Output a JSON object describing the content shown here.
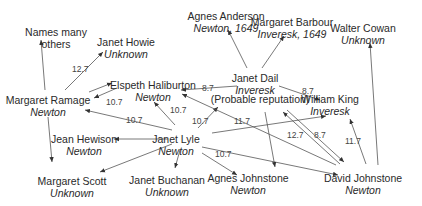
{
  "nodes": [
    {
      "id": "names_many",
      "name": "Names many",
      "sub": "others",
      "sub_italic": false
    },
    {
      "id": "janet_howie",
      "name": "Janet Howie",
      "sub": "Unknown"
    },
    {
      "id": "agnes_anderson",
      "name": "Agnes Anderson",
      "sub": "Newton, 1649"
    },
    {
      "id": "margaret_barbour",
      "name": "Margaret Barbour",
      "sub": "Inveresk, 1649"
    },
    {
      "id": "walter_cowan",
      "name": "Walter Cowan",
      "sub": "Unknown"
    },
    {
      "id": "margaret_ramage",
      "name": "Margaret Ramage",
      "sub": "Newton"
    },
    {
      "id": "elspeth_haliburton",
      "name": "Elspeth Haliburton",
      "sub": "Newton"
    },
    {
      "id": "janet_dail",
      "name": "Janet Dail",
      "sub": "Inveresk"
    },
    {
      "id": "probable_reputation",
      "name": "(Probable reputation)",
      "sub": ""
    },
    {
      "id": "william_king",
      "name": "William King",
      "sub": "Inveresk"
    },
    {
      "id": "jean_hewison",
      "name": "Jean Hewison",
      "sub": "Newton"
    },
    {
      "id": "janet_lyle",
      "name": "Janet Lyle",
      "sub": "Newton"
    },
    {
      "id": "margaret_scott",
      "name": "Margaret Scott",
      "sub": "Unknown"
    },
    {
      "id": "janet_buchanan",
      "name": "Janet Buchanan",
      "sub": "Unknown"
    },
    {
      "id": "agnes_johnstone",
      "name": "Agnes Johnstone",
      "sub": "Newton"
    },
    {
      "id": "david_johnstone",
      "name": "David Johnstone",
      "sub": "Newton"
    }
  ],
  "edges": [
    {
      "from": "margaret_ramage",
      "to": "names_many",
      "label": ""
    },
    {
      "from": "margaret_ramage",
      "to": "janet_howie",
      "label": "12.7"
    },
    {
      "from": "margaret_ramage",
      "to": "elspeth_haliburton",
      "label": ""
    },
    {
      "from": "elspeth_haliburton",
      "to": "margaret_ramage",
      "label": "10.7"
    },
    {
      "from": "margaret_ramage",
      "to": "margaret_scott",
      "label": ""
    },
    {
      "from": "janet_dail",
      "to": "agnes_anderson",
      "label": ""
    },
    {
      "from": "janet_dail",
      "to": "margaret_barbour",
      "label": ""
    },
    {
      "from": "janet_dail",
      "to": "elspeth_haliburton",
      "label": "8.7"
    },
    {
      "from": "janet_dail",
      "to": "william_king",
      "label": "8.7"
    },
    {
      "from": "janet_lyle",
      "to": "margaret_ramage",
      "label": "10.7"
    },
    {
      "from": "janet_lyle",
      "to": "elspeth_haliburton",
      "label": "10.7"
    },
    {
      "from": "janet_lyle",
      "to": "probable_reputation",
      "label": "10.7"
    },
    {
      "from": "janet_lyle",
      "to": "jean_hewison",
      "label": ""
    },
    {
      "from": "janet_lyle",
      "to": "margaret_scott",
      "label": ""
    },
    {
      "from": "janet_lyle",
      "to": "janet_buchanan",
      "label": ""
    },
    {
      "from": "janet_lyle",
      "to": "agnes_johnstone",
      "label": "10.7"
    },
    {
      "from": "janet_lyle",
      "to": "david_johnstone",
      "label": ""
    },
    {
      "from": "janet_lyle",
      "to": "william_king",
      "label": ""
    },
    {
      "from": "david_johnstone",
      "to": "elspeth_haliburton",
      "label": "11.7"
    },
    {
      "from": "david_johnstone",
      "to": "probable_reputation",
      "label": "12.7"
    },
    {
      "from": "probable_reputation",
      "to": "david_johnstone",
      "label": "8.7"
    },
    {
      "from": "david_johnstone",
      "to": "william_king",
      "label": "11.7"
    },
    {
      "from": "david_johnstone",
      "to": "walter_cowan",
      "label": ""
    },
    {
      "from": "probable_reputation",
      "to": "agnes_johnstone",
      "label": ""
    }
  ],
  "colors": {
    "line": "#555555",
    "text": "#2a2a2a"
  }
}
